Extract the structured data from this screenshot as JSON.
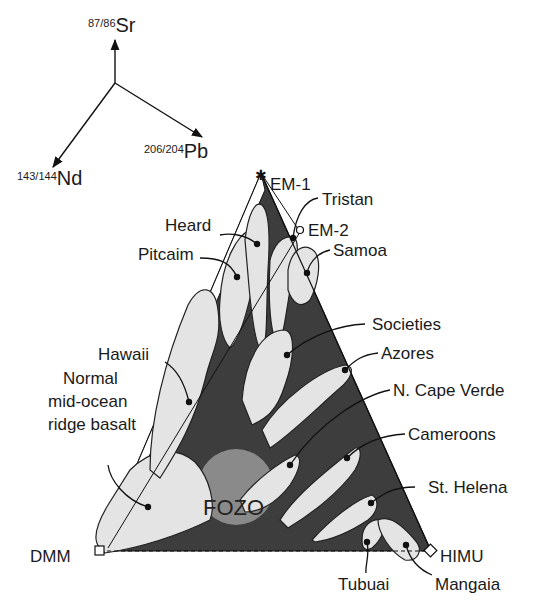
{
  "axes": {
    "sr": {
      "ratio": "87/86",
      "element": "Sr"
    },
    "pb": {
      "ratio": "206/204",
      "element": "Pb"
    },
    "nd": {
      "ratio": "143/144",
      "element": "Nd"
    }
  },
  "endmembers": {
    "em1": "EM-1",
    "em2": "EM-2",
    "dmm": "DMM",
    "himu": "HIMU",
    "fozo": "FOZO"
  },
  "labels": {
    "tristan": "Tristan",
    "heard": "Heard",
    "pitcaim": "Pitcaim",
    "samoa": "Samoa",
    "societies": "Societies",
    "hawaii": "Hawaii",
    "azores": "Azores",
    "morb_1": "Normal",
    "morb_2": "mid-ocean",
    "morb_3": "ridge basalt",
    "cape_verde": "N. Cape Verde",
    "cameroons": "Cameroons",
    "st_helena": "St. Helena",
    "tubuai": "Tubuai",
    "mangaia": "Mangaia"
  },
  "colors": {
    "triangle_fill": "#3d3d3d",
    "field_fill": "#e4e4e4",
    "fozo_fill": "#8a8a8a"
  }
}
